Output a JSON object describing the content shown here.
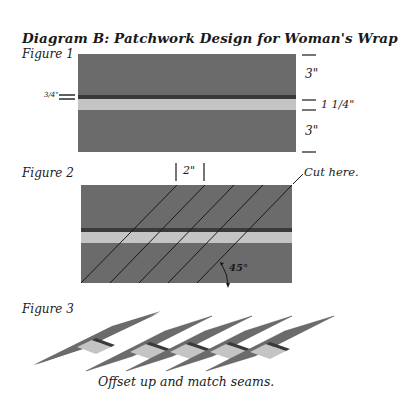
{
  "title": "Diagram B: Patchwork Design for Woman's Wrap",
  "figures": {
    "fig1": {
      "label": "Figure 1",
      "dim_left": "3/4\"",
      "dim_top": "3\"",
      "dim_middle": "1 1/4\"",
      "dim_bottom": "3\""
    },
    "fig2": {
      "label": "Figure 2",
      "dim_spacing": "2\"",
      "cut_label": "Cut here.",
      "angle_label": "45°"
    },
    "fig3": {
      "label": "Figure 3",
      "caption": "Offset up and match seams."
    }
  },
  "colors": {
    "dark_fabric": "#6b6b6b",
    "seam_stripe": "#3a3a3a",
    "light_stripe": "#c4c4c4",
    "line": "#1a1a1a"
  }
}
